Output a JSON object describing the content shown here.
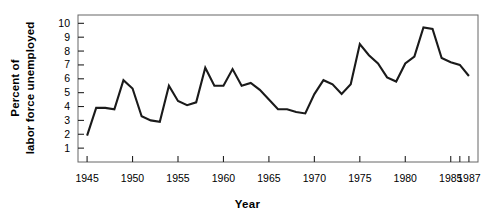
{
  "chart_data": {
    "type": "line",
    "title": "",
    "xlabel": "Year",
    "ylabel": "Percent of labor force unemployed",
    "ylabel_line1": "Percent of",
    "ylabel_line2": "labor force unemployed",
    "xlim": [
      1944,
      1988
    ],
    "ylim": [
      0,
      10.6
    ],
    "grid": false,
    "legend": null,
    "line_color": "#1a1a1a",
    "frame_color": "#666666",
    "y_ticks": [
      1,
      2,
      3,
      4,
      5,
      6,
      7,
      8,
      9,
      10
    ],
    "y_tick_labels": [
      "1",
      "2",
      "3",
      "4",
      "5",
      "6",
      "7",
      "8",
      "9",
      "10"
    ],
    "x_ticks": [
      1945,
      1950,
      1955,
      1960,
      1965,
      1970,
      1975,
      1980,
      1985,
      1986,
      1987
    ],
    "x_tick_labels": [
      "1945",
      "1950",
      "1955",
      "1960",
      "1965",
      "1970",
      "1975",
      "1980",
      "1985",
      "",
      "1987"
    ],
    "x": [
      1945,
      1946,
      1947,
      1948,
      1949,
      1950,
      1951,
      1952,
      1953,
      1954,
      1955,
      1956,
      1957,
      1958,
      1959,
      1960,
      1961,
      1962,
      1963,
      1964,
      1965,
      1966,
      1967,
      1968,
      1969,
      1970,
      1971,
      1972,
      1973,
      1974,
      1975,
      1976,
      1977,
      1978,
      1979,
      1980,
      1981,
      1982,
      1983,
      1984,
      1985,
      1986,
      1987
    ],
    "values": [
      1.9,
      3.9,
      3.9,
      3.8,
      5.9,
      5.3,
      3.3,
      3.0,
      2.9,
      5.5,
      4.4,
      4.1,
      4.3,
      6.8,
      5.5,
      5.5,
      6.7,
      5.5,
      5.7,
      5.2,
      4.5,
      3.8,
      3.8,
      3.6,
      3.5,
      4.9,
      5.9,
      5.6,
      4.9,
      5.6,
      8.5,
      7.7,
      7.1,
      6.1,
      5.8,
      7.1,
      7.6,
      9.7,
      9.6,
      7.5,
      7.2,
      7.0,
      6.2
    ],
    "series_name": "Percent of labor force unemployed"
  }
}
